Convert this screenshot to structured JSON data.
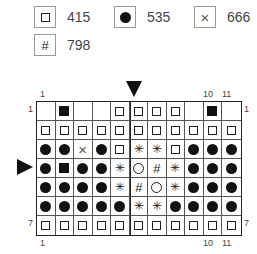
{
  "legend": [
    {
      "symbol": "empty-square",
      "glyph": "",
      "label": "415"
    },
    {
      "symbol": "filled-dot",
      "glyph": "",
      "label": "535"
    },
    {
      "symbol": "cross",
      "glyph": "×",
      "label": "666"
    },
    {
      "symbol": "hash",
      "glyph": "#",
      "label": "798"
    }
  ],
  "grid": {
    "columns": 11,
    "rows": 7,
    "thick_divider_before_col": 6,
    "cells": [
      [
        "blank",
        "fsq",
        "blank",
        "blank",
        "esq",
        "esq",
        "esq",
        "esq",
        "blank",
        "fsq",
        "blank"
      ],
      [
        "esq",
        "esq",
        "esq",
        "esq",
        "esq",
        "esq",
        "esq",
        "esq",
        "esq",
        "esq",
        "esq"
      ],
      [
        "dot",
        "dot",
        "x",
        "dot",
        "esq",
        "star",
        "star",
        "esq",
        "dot",
        "dot",
        "dot"
      ],
      [
        "dot",
        "fsq",
        "dot",
        "dot",
        "star",
        "circ",
        "hash",
        "star",
        "dot",
        "dot",
        "dot"
      ],
      [
        "dot",
        "dot",
        "dot",
        "dot",
        "star",
        "hash",
        "circ",
        "star",
        "dot",
        "dot",
        "dot"
      ],
      [
        "dot",
        "dot",
        "dot",
        "dot",
        "dot",
        "star",
        "star",
        "dot",
        "dot",
        "dot",
        "dot"
      ],
      [
        "esq",
        "esq",
        "esq",
        "esq",
        "esq",
        "esq",
        "esq",
        "esq",
        "esq",
        "esq",
        "esq"
      ]
    ]
  },
  "labels": {
    "top_col_1": "1",
    "top_col_10": "10",
    "top_col_11": "11",
    "bottom_col_1": "1",
    "bottom_col_10": "10",
    "bottom_col_11": "11",
    "left_row_1": "1",
    "right_row_1": "1",
    "left_row_7": "7",
    "right_row_7": "7"
  },
  "markers": {
    "top_arrow_col": 6,
    "side_arrow_row": 4
  }
}
